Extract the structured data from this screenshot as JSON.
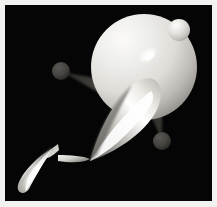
{
  "scene": {
    "title": "3D rendered scene",
    "canvas": {
      "width": 217,
      "height": 207,
      "background_color": "#050505",
      "frame_color": "#f2f2f0",
      "frame_inset_px": 5
    },
    "lighting": {
      "key_light_direction": "upper-left",
      "specular_highlight_color": "#ffffff",
      "ambient_color": "#101010"
    },
    "objects": [
      {
        "id": "main-sphere",
        "type": "sphere",
        "label": "Large lit sphere",
        "cx": 144,
        "cy": 67,
        "r": 53,
        "base_color": "#e8e7e2",
        "shadow_color": "#8f8d88"
      },
      {
        "id": "head-nub-sphere",
        "type": "sphere",
        "label": "Small bright sphere on upper right",
        "cx": 179,
        "cy": 30,
        "r": 11,
        "base_color": "#e6e5e0",
        "shadow_color": "#9b9994"
      },
      {
        "id": "main-cone",
        "type": "cone",
        "label": "Large cone, apex lower-left",
        "apex_x": 90,
        "apex_y": 161,
        "base_cx": 139,
        "base_cy": 92,
        "base_r": 25,
        "base_color": "#f4f3ef",
        "shadow_color": "#6d6b67"
      },
      {
        "id": "mid-cone",
        "type": "cone",
        "label": "Middle small cone, apex left",
        "apex_x": 58,
        "apex_y": 155,
        "base_cx": 88,
        "base_cy": 160,
        "base_r": 8,
        "base_color": "#e9e8e4",
        "shadow_color": "#6b6965"
      },
      {
        "id": "tip-cone",
        "type": "cone",
        "label": "Small cone pointing up-right",
        "apex_x": 57,
        "apex_y": 144,
        "base_cx": 43,
        "base_cy": 155,
        "base_r": 6,
        "base_color": "#dedcd8",
        "shadow_color": "#6a6864"
      },
      {
        "id": "foot-cone",
        "type": "cone",
        "label": "Lower-left cone, apex upper-right",
        "apex_x": 53,
        "apex_y": 148,
        "base_cx": 26,
        "base_cy": 188,
        "base_r": 12,
        "base_color": "#f2f1ed",
        "shadow_color": "#696763"
      },
      {
        "id": "left-dim-sphere",
        "type": "sphere",
        "label": "Dim grey sphere, upper left",
        "cx": 61,
        "cy": 71,
        "r": 9,
        "base_color": "#4a4845",
        "shadow_color": "#201f1e"
      },
      {
        "id": "right-dim-sphere",
        "type": "sphere",
        "label": "Dim grey sphere, lower right",
        "cx": 162,
        "cy": 141,
        "r": 9,
        "base_color": "#4a4845",
        "shadow_color": "#201f1e"
      },
      {
        "id": "left-arm-cone",
        "type": "cone",
        "label": "Dim tapered arm to left sphere",
        "apex_x": 63,
        "apex_y": 72,
        "base_cx": 112,
        "base_cy": 88,
        "base_r": 12,
        "base_color": "#3a3835",
        "shadow_color": "#1a1918"
      },
      {
        "id": "right-arm-cone",
        "type": "cone",
        "label": "Dim tapered arm to right sphere",
        "apex_x": 161,
        "apex_y": 139,
        "base_cx": 150,
        "base_cy": 100,
        "base_r": 11,
        "base_color": "#343230",
        "shadow_color": "#161514"
      }
    ],
    "highlights": [
      {
        "id": "sphere-specular",
        "label": "Specular streak on large sphere",
        "cx": 148,
        "cy": 55,
        "rx": 11,
        "ry": 6,
        "rotation_deg": -38,
        "color": "#ffffff"
      },
      {
        "id": "nub-specular",
        "label": "Specular arc on small sphere",
        "cx": 177,
        "cy": 26,
        "rx": 6,
        "ry": 4,
        "rotation_deg": -30,
        "color": "#fbfbf9"
      }
    ]
  }
}
